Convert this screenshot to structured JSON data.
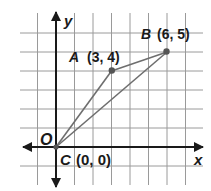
{
  "diagram": {
    "type": "coordinate-plane",
    "axes": {
      "x_label": "x",
      "y_label": "y",
      "origin_label": "O"
    },
    "points": [
      {
        "name": "A",
        "coords": "(3, 4)",
        "x": 3,
        "y": 4
      },
      {
        "name": "B",
        "coords": "(6, 5)",
        "x": 6,
        "y": 5
      },
      {
        "name": "C",
        "coords": "(0, 0)",
        "x": 0,
        "y": 0
      }
    ],
    "segments": [
      [
        "C",
        "A"
      ],
      [
        "A",
        "B"
      ],
      [
        "B",
        "C"
      ]
    ],
    "grid": {
      "x_range": [
        -1,
        7
      ],
      "y_range": [
        -1,
        6
      ]
    },
    "colors": {
      "axis": "#1a1a1a",
      "grid": "#9a9a9a",
      "edge": "#6e6e6e",
      "point": "#555555"
    }
  }
}
